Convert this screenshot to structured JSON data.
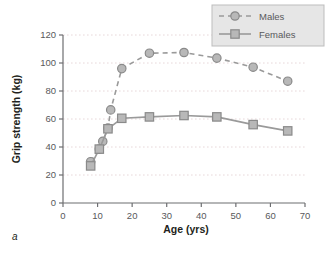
{
  "panel": {
    "letter": "a"
  },
  "chart_data": {
    "type": "line",
    "title": "",
    "xlabel": "Age (yrs)",
    "ylabel": "Grip strength (kg)",
    "xlim": [
      0,
      70
    ],
    "ylim": [
      0,
      120
    ],
    "xticks": [
      0,
      10,
      20,
      30,
      40,
      50,
      60,
      70
    ],
    "yticks": [
      0,
      20,
      40,
      60,
      80,
      100,
      120
    ],
    "grid": "horizontal-dotted",
    "legend_position": "top-right",
    "series": [
      {
        "name": "Males",
        "line_style": "dashed",
        "marker": "circle",
        "color": "#9a9a9a",
        "marker_fill": "#b8b8b8",
        "x": [
          8,
          10.5,
          11.5,
          13,
          13.8,
          17,
          25,
          35,
          44.5,
          55,
          65
        ],
        "values": [
          29.5,
          38.5,
          44,
          53.5,
          66.5,
          96,
          107,
          107.5,
          103.5,
          97,
          87
        ]
      },
      {
        "name": "Females",
        "line_style": "solid",
        "marker": "square",
        "color": "#9a9a9a",
        "marker_fill": "#b8b8b8",
        "x": [
          8,
          10.5,
          13,
          17,
          25,
          35,
          44.5,
          55,
          65
        ],
        "values": [
          26.5,
          38.5,
          53,
          60.5,
          61.5,
          62.5,
          61.5,
          56,
          51.5
        ]
      }
    ]
  },
  "legend": {
    "entries": [
      {
        "label": "Males"
      },
      {
        "label": "Females"
      }
    ]
  },
  "colors": {
    "axis": "#6d6e71",
    "grid": "#e8d8da",
    "series": "#9a9a9a",
    "marker_fill": "#b8b8b8",
    "text": "#231f20",
    "legend_bg": "#e6e6e6"
  }
}
